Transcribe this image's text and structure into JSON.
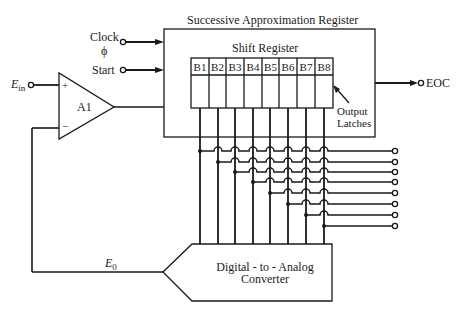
{
  "diagram": {
    "type": "successive-approximation ADC block diagram",
    "sar": {
      "title": "Successive Approximation Register",
      "shift_register_label": "Shift Register",
      "bits": [
        "B1",
        "B2",
        "B3",
        "B4",
        "B5",
        "B6",
        "B7",
        "B8"
      ],
      "latches_label_line1": "Output",
      "latches_label_line2": "Latches"
    },
    "inputs": {
      "clock_label": "Clock",
      "clock_symbol": "ϕ",
      "start_label": "Start",
      "ein_label": "E",
      "ein_sub": "in"
    },
    "comparator": {
      "label": "A1",
      "plus": "+",
      "minus": "−"
    },
    "outputs": {
      "eoc_label": "EOC",
      "digital_outputs_count": 8
    },
    "dac": {
      "line1": "Digital - to - Analog",
      "line2": "Converter",
      "output_label": "E",
      "output_sub": "0"
    },
    "colors": {
      "line": "#1a1a1a",
      "background": "#ffffff"
    }
  }
}
